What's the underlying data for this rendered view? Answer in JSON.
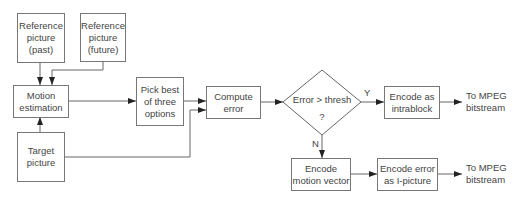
{
  "diagram": {
    "line_color": "#666666",
    "nodes": {
      "ref_past": {
        "text": "Reference picture (past)",
        "lines": [
          "Reference",
          "picture",
          "(past)"
        ]
      },
      "ref_future": {
        "text": "Reference picture (future)",
        "lines": [
          "Reference",
          "picture",
          "(future)"
        ]
      },
      "motion_est": {
        "text": "Motion estimation",
        "lines": [
          "Motion",
          "estimation"
        ]
      },
      "target": {
        "text": "Target picture",
        "lines": [
          "Target",
          "picture"
        ]
      },
      "pick_best": {
        "text": "Pick best of three options",
        "lines": [
          "Pick best",
          "of three",
          "options"
        ]
      },
      "compute_error": {
        "text": "Compute error",
        "lines": [
          "Compute",
          "error"
        ]
      },
      "decision": {
        "text": "Error > thresh ?",
        "lines": [
          "Error > thresh",
          "?"
        ]
      },
      "encode_intra": {
        "text": "Encode as intrablock",
        "lines": [
          "Encode as",
          "intrablock"
        ]
      },
      "encode_mv": {
        "text": "Encode motion vector",
        "lines": [
          "Encode",
          "motion vector"
        ]
      },
      "encode_err": {
        "text": "Encode error as I-picture",
        "lines": [
          "Encode error",
          "as I-picture"
        ]
      },
      "out_top": {
        "lines": [
          "To MPEG",
          "bitstream"
        ]
      },
      "out_bottom": {
        "lines": [
          "To MPEG",
          "bitstream"
        ]
      }
    },
    "edge_labels": {
      "yes": "Y",
      "no": "N"
    },
    "edges": [
      {
        "from": "ref_past",
        "to": "motion_est"
      },
      {
        "from": "ref_future",
        "to": "motion_est"
      },
      {
        "from": "target",
        "to": "motion_est"
      },
      {
        "from": "motion_est",
        "to": "pick_best"
      },
      {
        "from": "pick_best",
        "to": "compute_error"
      },
      {
        "from": "target",
        "to": "compute_error"
      },
      {
        "from": "compute_error",
        "to": "decision"
      },
      {
        "from": "decision",
        "to": "encode_intra",
        "label": "Y"
      },
      {
        "from": "decision",
        "to": "encode_mv",
        "label": "N"
      },
      {
        "from": "encode_intra",
        "to": "out_top"
      },
      {
        "from": "encode_mv",
        "to": "encode_err"
      },
      {
        "from": "encode_err",
        "to": "out_bottom"
      }
    ]
  }
}
